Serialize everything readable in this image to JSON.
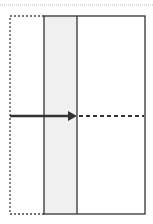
{
  "diagram": {
    "colors": {
      "stroke": "#333333",
      "shade": "#f0f0f0",
      "top_rule": "#bbbbbb",
      "background": "#ffffff"
    },
    "top_rule": {
      "y": 5,
      "x1": 0,
      "x2": 153,
      "style": "dotted"
    },
    "dotted_box": {
      "x": 10,
      "y": 16,
      "w": 34,
      "h": 198,
      "style": "dotted"
    },
    "solid_box": {
      "x": 44,
      "y": 16,
      "w": 101,
      "h": 198
    },
    "shaded_column": {
      "x": 44,
      "y": 16,
      "w": 33,
      "h": 198
    },
    "divider": {
      "x": 77,
      "y1": 16,
      "y2": 214
    },
    "arrow": {
      "y": 116,
      "x_start": 10,
      "x_head": 77,
      "style": "solid"
    },
    "dashed_extension": {
      "y": 116,
      "x1": 78,
      "x2": 144,
      "style": "dashed"
    }
  }
}
